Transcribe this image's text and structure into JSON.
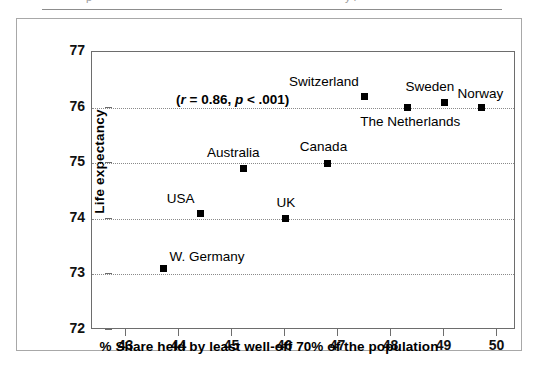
{
  "figure": {
    "top_fragment_left": "p",
    "top_fragment_right": "y f"
  },
  "chart_data": {
    "type": "scatter",
    "title": "",
    "xlabel": "% Share held by least well-off 70% of the population",
    "ylabel": "Life expectancy",
    "xlim": [
      42.35,
      50.35
    ],
    "ylim": [
      72,
      77
    ],
    "xticks": [
      43,
      44,
      45,
      46,
      47,
      48,
      49,
      50
    ],
    "yticks": [
      72,
      73,
      74,
      75,
      76,
      77
    ],
    "grid": "horizontal-dotted",
    "legend": "none",
    "annotation": {
      "text": "(r = 0.86, p < .001)",
      "r": "0.86",
      "p": "< .001",
      "prefix": "(",
      "r_symbol": "r",
      "r_equals": " = 0.86, ",
      "p_symbol": "p",
      "p_value": " < .001)"
    },
    "points": [
      {
        "label": "W. Germany",
        "x": 43.7,
        "y": 73.1,
        "label_dx": 6,
        "label_dy": -20
      },
      {
        "label": "USA",
        "x": 44.4,
        "y": 74.1,
        "label_dx": -34,
        "label_dy": -22
      },
      {
        "label": "Australia",
        "x": 45.2,
        "y": 74.9,
        "label_dx": -36,
        "label_dy": -24
      },
      {
        "label": "UK",
        "x": 46.0,
        "y": 74.0,
        "label_dx": -9,
        "label_dy": -24
      },
      {
        "label": "Canada",
        "x": 46.8,
        "y": 75.0,
        "label_dx": -28,
        "label_dy": -24
      },
      {
        "label": "Switzerland",
        "x": 47.5,
        "y": 76.2,
        "label_dx": -76,
        "label_dy": -22
      },
      {
        "label": "The Netherlands",
        "x": 48.3,
        "y": 76.0,
        "label_dx": -47,
        "label_dy": 6
      },
      {
        "label": "Sweden",
        "x": 49.0,
        "y": 76.1,
        "label_dx": -39,
        "label_dy": -23
      },
      {
        "label": "Norway",
        "x": 49.7,
        "y": 76.0,
        "label_dx": -24,
        "label_dy": -22
      }
    ]
  }
}
